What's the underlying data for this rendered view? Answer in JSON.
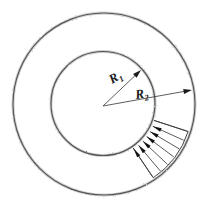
{
  "figure": {
    "title": "Annulus cross-section with inner radius R1 and outer radius R2",
    "background_color": "#ffffff",
    "width": 211,
    "height": 211,
    "stroke_color": "#3a3a3a",
    "accent_color": "#121212"
  },
  "geometry": {
    "center": {
      "x": 103.5,
      "y": 104.0
    },
    "center_vertex": {
      "x": 103.0,
      "y": 106.0
    },
    "inner_circle": {
      "name": "inner-circle",
      "cx": 103.0,
      "cy": 103.5,
      "r": 52.0
    },
    "outer_circle": {
      "name": "outer-circle",
      "cx": 104.0,
      "cy": 104.0,
      "r": 91.0
    }
  },
  "dimensions": [
    {
      "id": "r1",
      "label": "R",
      "subscript": "1",
      "label_x": 112,
      "label_y": 84,
      "from": {
        "x": 103.0,
        "y": 106.0
      },
      "to": {
        "x": 141.0,
        "y": 70.0
      },
      "arrow_at": "to",
      "angle_deg": 43.5,
      "describes": "inner radius"
    },
    {
      "id": "r2",
      "label": "R",
      "subscript": "2",
      "label_x": 136,
      "label_y": 99,
      "from": {
        "x": 103.0,
        "y": 106.0
      },
      "to": {
        "x": 192.0,
        "y": 90.0
      },
      "arrow_at": "to",
      "angle_deg": 10.2,
      "describes": "outer radius"
    }
  ],
  "load": {
    "name": "distributed-load",
    "description": "Hatched fan of inward-pointing arrows across the annulus at lower right",
    "start_angle_deg": 18,
    "end_angle_deg": 56,
    "arrow_count": 6,
    "direction": "inward",
    "arrow_color": "#121212",
    "hatch_color": "#3c3c3c"
  }
}
